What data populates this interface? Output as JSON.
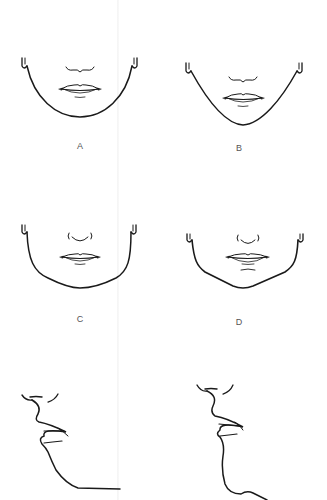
{
  "figure": {
    "stroke_color": "#1a1a1a",
    "label_color": "#555555",
    "background": "#ffffff"
  },
  "panels": [
    {
      "id": "A",
      "label": "A",
      "view": "front",
      "jaw_shape": "round"
    },
    {
      "id": "B",
      "label": "B",
      "view": "front",
      "jaw_shape": "v-shaped"
    },
    {
      "id": "C",
      "label": "C",
      "view": "front",
      "jaw_shape": "square-round"
    },
    {
      "id": "D",
      "label": "D",
      "view": "front",
      "jaw_shape": "angular"
    },
    {
      "id": "profile-left",
      "label": "",
      "view": "profile",
      "jaw_shape": "receding chin"
    },
    {
      "id": "profile-right",
      "label": "",
      "view": "profile",
      "jaw_shape": "defined chin"
    }
  ]
}
